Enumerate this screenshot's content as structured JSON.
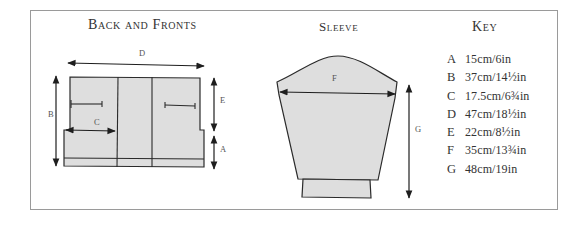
{
  "sections": {
    "back_and_fronts": {
      "title": "Back and Fronts",
      "labels": {
        "D": "D",
        "B": "B",
        "C": "C",
        "E": "E",
        "A": "A"
      }
    },
    "sleeve": {
      "title": "Sleeve",
      "labels": {
        "F": "F",
        "G": "G"
      }
    },
    "key": {
      "title": "Key",
      "items": [
        {
          "letter": "A",
          "value": "15cm/6in"
        },
        {
          "letter": "B",
          "value": "37cm/14½in"
        },
        {
          "letter": "C",
          "value": "17.5cm/6¾in"
        },
        {
          "letter": "D",
          "value": "47cm/18½in"
        },
        {
          "letter": "E",
          "value": "22cm/8½in"
        },
        {
          "letter": "F",
          "value": "35cm/13¾in"
        },
        {
          "letter": "G",
          "value": "48cm/19in"
        }
      ]
    }
  },
  "colors": {
    "fill": "#dedede",
    "stroke": "#2a2a2a",
    "frame": "#9a9a9a"
  }
}
